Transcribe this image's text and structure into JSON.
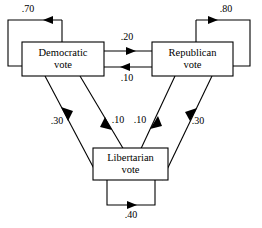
{
  "diagram": {
    "type": "state-transition-diagram",
    "title": "",
    "nodes": [
      {
        "id": "democratic",
        "label_line1": "Democratic",
        "label_line2": "vote",
        "x": 22,
        "y": 42,
        "w": 82,
        "h": 34
      },
      {
        "id": "republican",
        "label_line1": "Republican",
        "label_line2": "vote",
        "x": 152,
        "y": 42,
        "w": 81,
        "h": 34
      },
      {
        "id": "libertarian",
        "label_line1": "Libertarian",
        "label_line2": "vote",
        "x": 93,
        "y": 148,
        "w": 75,
        "h": 32
      }
    ],
    "edges": [
      {
        "id": "dem-self",
        "from": "democratic",
        "to": "democratic",
        "value": ".70",
        "label_x": 28,
        "label_y": 10
      },
      {
        "id": "rep-self",
        "from": "republican",
        "to": "republican",
        "value": ".80",
        "label_x": 226,
        "label_y": 10
      },
      {
        "id": "lib-self",
        "from": "libertarian",
        "to": "libertarian",
        "value": ".40",
        "label_x": 131,
        "label_y": 216
      },
      {
        "id": "dem-to-rep",
        "from": "democratic",
        "to": "republican",
        "value": ".20",
        "label_x": 127,
        "label_y": 38
      },
      {
        "id": "rep-to-dem",
        "from": "republican",
        "to": "democratic",
        "value": ".10",
        "label_x": 127,
        "label_y": 79
      },
      {
        "id": "dem-to-lib",
        "from": "democratic",
        "to": "libertarian",
        "value": ".10",
        "label_x": 116,
        "label_y": 121
      },
      {
        "id": "lib-to-dem",
        "from": "libertarian",
        "to": "democratic",
        "value": ".30",
        "label_x": 58,
        "label_y": 122
      },
      {
        "id": "rep-to-lib",
        "from": "republican",
        "to": "libertarian",
        "value": ".10",
        "label_x": 140,
        "label_y": 121
      },
      {
        "id": "lib-to-rep",
        "from": "libertarian",
        "to": "republican",
        "value": ".30",
        "label_x": 198,
        "label_y": 122
      }
    ],
    "colors": {
      "stroke": "#000000",
      "background": "#ffffff",
      "text": "#000000"
    }
  }
}
